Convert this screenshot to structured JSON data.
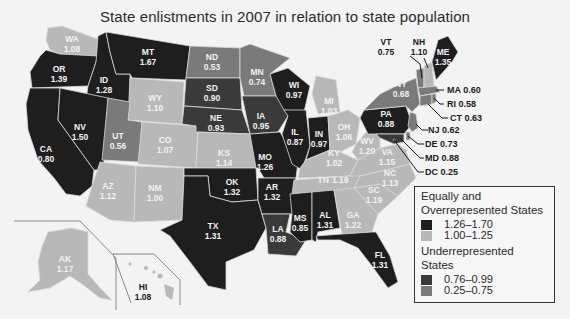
{
  "title": "State enlistments in 2007 in relation to state population",
  "colors": {
    "high": "#1e1e1e",
    "mid_high": "#b8b8b8",
    "mid_low": "#3a3a3a",
    "low": "#7a7a7a",
    "background": "#f3f3f3"
  },
  "legend": {
    "over_header": "Equally and Overrepresented States",
    "over_line1": "Equally and",
    "over_line2": "Overrepresented States",
    "over_items": [
      {
        "range": "1.26–1.70",
        "color": "#1e1e1e"
      },
      {
        "range": "1.00–1.25",
        "color": "#b8b8b8"
      }
    ],
    "under_header": "Underrepresented States",
    "under_line1": "Underrepresented",
    "under_line2": "States",
    "under_items": [
      {
        "range": "0.76–0.99",
        "color": "#3a3a3a"
      },
      {
        "range": "0.25–0.75",
        "color": "#7a7a7a"
      }
    ]
  },
  "states": {
    "WA": {
      "abbr": "WA",
      "value": "1.08"
    },
    "OR": {
      "abbr": "OR",
      "value": "1.39"
    },
    "CA": {
      "abbr": "CA",
      "value": "0.80"
    },
    "ID": {
      "abbr": "ID",
      "value": "1.28"
    },
    "NV": {
      "abbr": "NV",
      "value": "1.50"
    },
    "MT": {
      "abbr": "MT",
      "value": "1.67"
    },
    "WY": {
      "abbr": "WY",
      "value": "1.10"
    },
    "UT": {
      "abbr": "UT",
      "value": "0.56"
    },
    "CO": {
      "abbr": "CO",
      "value": "1.07"
    },
    "AZ": {
      "abbr": "AZ",
      "value": "1.12"
    },
    "NM": {
      "abbr": "NM",
      "value": "1.00"
    },
    "ND": {
      "abbr": "ND",
      "value": "0.53"
    },
    "SD": {
      "abbr": "SD",
      "value": "0.90"
    },
    "NE": {
      "abbr": "NE",
      "value": "0.93"
    },
    "KS": {
      "abbr": "KS",
      "value": "1.14"
    },
    "OK": {
      "abbr": "OK",
      "value": "1.32"
    },
    "TX": {
      "abbr": "TX",
      "value": "1.31"
    },
    "MN": {
      "abbr": "MN",
      "value": "0.74"
    },
    "IA": {
      "abbr": "IA",
      "value": "0.95"
    },
    "MO": {
      "abbr": "MO",
      "value": "1.26"
    },
    "AR": {
      "abbr": "AR",
      "value": "1.32"
    },
    "LA": {
      "abbr": "LA",
      "value": "0.88"
    },
    "WI": {
      "abbr": "WI",
      "value": "0.97"
    },
    "IL": {
      "abbr": "IL",
      "value": "0.87"
    },
    "MI": {
      "abbr": "MI",
      "value": "1.03"
    },
    "IN": {
      "abbr": "IN",
      "value": "0.97"
    },
    "OH": {
      "abbr": "OH",
      "value": "1.06"
    },
    "KY": {
      "abbr": "KY",
      "value": "1.02"
    },
    "TN": {
      "abbr": "TN",
      "value": "1.19"
    },
    "MS": {
      "abbr": "MS",
      "value": "0.85"
    },
    "AL": {
      "abbr": "AL",
      "value": "1.31"
    },
    "GA": {
      "abbr": "GA",
      "value": "1.22"
    },
    "FL": {
      "abbr": "FL",
      "value": "1.31"
    },
    "SC": {
      "abbr": "SC",
      "value": "1.19"
    },
    "NC": {
      "abbr": "NC",
      "value": "1.13"
    },
    "VA": {
      "abbr": "VA",
      "value": "1.15"
    },
    "WV": {
      "abbr": "WV",
      "value": "1.20"
    },
    "PA": {
      "abbr": "PA",
      "value": "0.88"
    },
    "NY": {
      "abbr": "NY",
      "value": "0.68"
    },
    "VT": {
      "abbr": "VT",
      "value": "0.75"
    },
    "NH": {
      "abbr": "NH",
      "value": "1.10"
    },
    "ME": {
      "abbr": "ME",
      "value": "1.35"
    },
    "MA": {
      "abbr": "MA",
      "value": "0.60"
    },
    "RI": {
      "abbr": "RI",
      "value": "0.58"
    },
    "CT": {
      "abbr": "CT",
      "value": "0.63"
    },
    "NJ": {
      "abbr": "NJ",
      "value": "0.62"
    },
    "DE": {
      "abbr": "DE",
      "value": "0.73"
    },
    "MD": {
      "abbr": "MD",
      "value": "0.88"
    },
    "DC": {
      "abbr": "DC",
      "value": "0.25"
    },
    "AK": {
      "abbr": "AK",
      "value": "1.17"
    },
    "HI": {
      "abbr": "HI",
      "value": "1.08"
    }
  },
  "callouts": {
    "MA": "MA 0.60",
    "RI": "RI 0.58",
    "CT": "CT 0.63",
    "NJ": "NJ 0.62",
    "DE": "DE 0.73",
    "MD": "MD 0.88",
    "DC": "DC 0.25"
  }
}
